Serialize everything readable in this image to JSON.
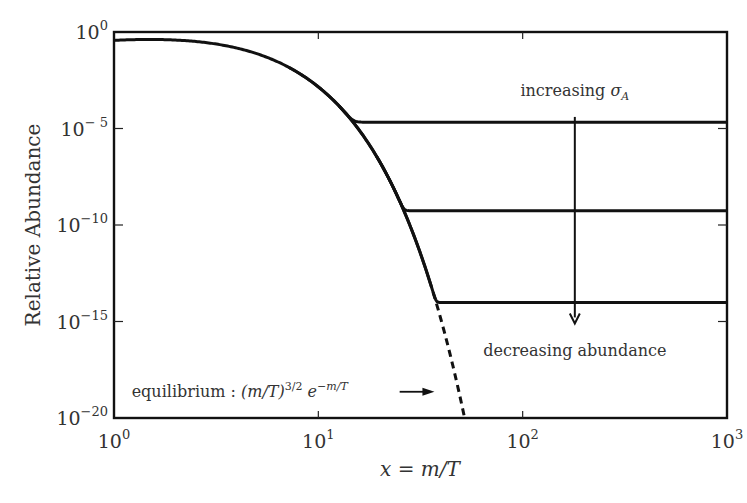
{
  "chart_data": {
    "type": "line",
    "title": "",
    "xlabel": "x = m/T",
    "ylabel": "Relative Abundance",
    "xscale": "log",
    "yscale": "log",
    "xlim": [
      1,
      1000
    ],
    "ylim": [
      1e-20,
      1
    ],
    "grid": false,
    "legend": null,
    "x_ticks": [
      {
        "value": 1,
        "base": "10",
        "exp": "0"
      },
      {
        "value": 10,
        "base": "10",
        "exp": "1"
      },
      {
        "value": 100,
        "base": "10",
        "exp": "2"
      },
      {
        "value": 1000,
        "base": "10",
        "exp": "3"
      }
    ],
    "y_ticks": [
      {
        "value": 1,
        "base": "10",
        "exp": "0"
      },
      {
        "value": 1e-05,
        "base": "10",
        "exp": "− 5"
      },
      {
        "value": 1e-10,
        "base": "10",
        "exp": "−10"
      },
      {
        "value": 1e-15,
        "base": "10",
        "exp": "−15"
      },
      {
        "value": 1e-20,
        "base": "10",
        "exp": "−20"
      }
    ],
    "equilibrium": {
      "formula": "(m/T)^{3/2} e^{-m/T}",
      "log10_offset": 0.0,
      "solid_until_x": 35,
      "dashed_until_x": 52
    },
    "series": [
      {
        "name": "small sigma_A",
        "freeze_out_x": 13,
        "plateau_log10": -4.95,
        "style": "solid"
      },
      {
        "name": "medium sigma_A",
        "freeze_out_x": 23,
        "plateau_log10": -9.6,
        "style": "solid"
      },
      {
        "name": "large sigma_A",
        "freeze_out_x": 35,
        "plateau_log10": -14.4,
        "style": "solid"
      }
    ],
    "annotations": [
      {
        "id": "increasing",
        "text": "increasing ",
        "math": "σ",
        "sub": "A",
        "x": 180,
        "log10_y": -3.3
      },
      {
        "id": "decreasing",
        "text": "decreasing abundance",
        "x": 180,
        "log10_y": -16.8
      },
      {
        "id": "equilibrium",
        "text": "equilibrium : ",
        "math": "(m/T)",
        "sup1": "3/2",
        "math2": " e",
        "sup2": "−m/T",
        "x": 1.22,
        "log10_y": -18.9
      }
    ],
    "arrows": [
      {
        "id": "sigma-arrow",
        "x": 180,
        "from_log10_y": -4.4,
        "to_log10_y": -15.1
      },
      {
        "id": "equilibrium-arrow",
        "from_x": 25,
        "to_x": 37,
        "log10_y": -18.9
      }
    ]
  }
}
